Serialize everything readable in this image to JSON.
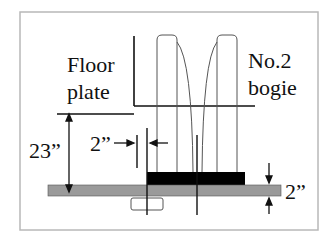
{
  "diagram": {
    "labels": {
      "floor_line1": "Floor",
      "floor_line2": "plate",
      "bogie_line1": "No.2",
      "bogie_line2": "bogie",
      "height_dim": "23”",
      "gap_dim": "2”",
      "thickness_dim": "2”"
    },
    "colors": {
      "frame": "#b8b8b8",
      "line": "#111111",
      "gray_plate": "#9a9a9a",
      "black_plate": "#000000",
      "wheel_outline": "#555555"
    }
  }
}
